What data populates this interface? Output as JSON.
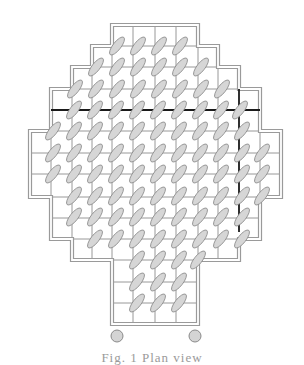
{
  "diagram": {
    "type": "grid-plan",
    "colors": {
      "background": "#ffffff",
      "grid_line": "#8c8c8c",
      "border_outer": "#9a9a9a",
      "border_inner": "#9a9a9a",
      "thick_line": "#1a1a1a",
      "ellipse_fill": "#d6d6d6",
      "ellipse_stroke": "#8a8a8a",
      "circle_fill": "#d4d4d4",
      "circle_stroke": "#8a8a8a"
    },
    "cell_size": 21,
    "outline": [
      [
        112,
        25
      ],
      [
        198,
        25
      ],
      [
        198,
        46
      ],
      [
        218,
        46
      ],
      [
        218,
        67
      ],
      [
        239,
        67
      ],
      [
        239,
        89
      ],
      [
        260,
        89
      ],
      [
        260,
        131
      ],
      [
        281,
        131
      ],
      [
        281,
        197
      ],
      [
        260,
        197
      ],
      [
        260,
        239
      ],
      [
        239,
        239
      ],
      [
        239,
        260
      ],
      [
        198,
        260
      ],
      [
        198,
        324
      ],
      [
        112,
        324
      ],
      [
        112,
        260
      ],
      [
        72,
        260
      ],
      [
        72,
        239
      ],
      [
        51,
        239
      ],
      [
        51,
        197
      ],
      [
        30,
        197
      ],
      [
        30,
        131
      ],
      [
        51,
        131
      ],
      [
        51,
        89
      ],
      [
        72,
        89
      ],
      [
        72,
        67
      ],
      [
        92,
        67
      ],
      [
        92,
        46
      ],
      [
        112,
        46
      ]
    ],
    "h_lines": [
      {
        "y": 46,
        "x1": 92,
        "x2": 218
      },
      {
        "y": 67,
        "x1": 72,
        "x2": 239
      },
      {
        "y": 89,
        "x1": 51,
        "x2": 260
      },
      {
        "y": 131,
        "x1": 30,
        "x2": 281
      },
      {
        "y": 153,
        "x1": 30,
        "x2": 281
      },
      {
        "y": 174,
        "x1": 30,
        "x2": 281
      },
      {
        "y": 197,
        "x1": 30,
        "x2": 281
      },
      {
        "y": 218,
        "x1": 51,
        "x2": 260
      },
      {
        "y": 239,
        "x1": 51,
        "x2": 260
      },
      {
        "y": 260,
        "x1": 72,
        "x2": 239
      },
      {
        "y": 282,
        "x1": 112,
        "x2": 198
      },
      {
        "y": 303,
        "x1": 112,
        "x2": 198
      }
    ],
    "v_lines": [
      {
        "x": 51,
        "y1": 131,
        "y2": 197
      },
      {
        "x": 72,
        "y1": 89,
        "y2": 239
      },
      {
        "x": 92,
        "y1": 67,
        "y2": 260
      },
      {
        "x": 112,
        "y1": 46,
        "y2": 260
      },
      {
        "x": 133,
        "y1": 25,
        "y2": 324
      },
      {
        "x": 155,
        "y1": 25,
        "y2": 324
      },
      {
        "x": 176,
        "y1": 25,
        "y2": 324
      },
      {
        "x": 198,
        "y1": 46,
        "y2": 260
      },
      {
        "x": 218,
        "y1": 67,
        "y2": 260
      },
      {
        "x": 260,
        "y1": 131,
        "y2": 197
      }
    ],
    "thick_lines": [
      {
        "x1": 51,
        "y1": 110,
        "x2": 260,
        "y2": 110
      },
      {
        "x1": 239,
        "y1": 89,
        "x2": 239,
        "y2": 232
      }
    ],
    "ellipse_rows": [
      {
        "y": 46,
        "xs": [
          117,
          138,
          159,
          180
        ]
      },
      {
        "y": 67,
        "xs": [
          96,
          117,
          138,
          159,
          180,
          201
        ]
      },
      {
        "y": 89,
        "xs": [
          75,
          96,
          117,
          138,
          159,
          180,
          201,
          222
        ]
      },
      {
        "y": 110,
        "xs": [
          74,
          95,
          116,
          137,
          158,
          179,
          200,
          221,
          240
        ]
      },
      {
        "y": 131,
        "xs": [
          53,
          74,
          95,
          116,
          137,
          158,
          179,
          200,
          221,
          242
        ]
      },
      {
        "y": 153,
        "xs": [
          53,
          74,
          95,
          116,
          137,
          158,
          179,
          200,
          221,
          242,
          262
        ]
      },
      {
        "y": 174,
        "xs": [
          53,
          74,
          95,
          116,
          137,
          158,
          179,
          200,
          221,
          242,
          262
        ]
      },
      {
        "y": 196,
        "xs": [
          74,
          95,
          116,
          137,
          158,
          179,
          200,
          221,
          242,
          262
        ]
      },
      {
        "y": 217,
        "xs": [
          74,
          95,
          116,
          137,
          158,
          179,
          200,
          221,
          242
        ]
      },
      {
        "y": 239,
        "xs": [
          95,
          116,
          137,
          158,
          179,
          200,
          221,
          242
        ]
      },
      {
        "y": 260,
        "xs": [
          137,
          158,
          179,
          198
        ]
      },
      {
        "y": 282,
        "xs": [
          137,
          158,
          179
        ]
      },
      {
        "y": 303,
        "xs": [
          137,
          158,
          179
        ]
      }
    ],
    "ellipse": {
      "rx": 11,
      "ry": 4,
      "angle": -52
    },
    "circles": [
      {
        "cx": 117,
        "cy": 336,
        "r": 6
      },
      {
        "cx": 195,
        "cy": 336,
        "r": 6
      }
    ]
  },
  "caption": {
    "text": "Fig. 1 Plan view"
  }
}
